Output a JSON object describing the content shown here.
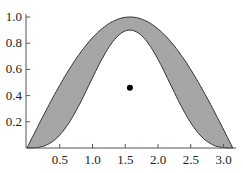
{
  "chart_data": {
    "type": "area",
    "title": "",
    "xlabel": "",
    "ylabel": "",
    "xlim": [
      0,
      3.1416
    ],
    "ylim": [
      0,
      1.0
    ],
    "x_ticks": [
      "0.5",
      "1.0",
      "1.5",
      "2.0",
      "2.5",
      "3.0"
    ],
    "y_ticks": [
      "0.2",
      "0.4",
      "0.6",
      "0.8",
      "1.0"
    ],
    "grid": false,
    "legend": null,
    "series": [
      {
        "name": "upper",
        "description": "sin(x)",
        "peak": 1.0,
        "x_peak": 1.571
      },
      {
        "name": "lower",
        "description": "approx 0.9*sin(x)^3",
        "peak": 0.9,
        "x_peak": 1.571
      }
    ],
    "fill_between": {
      "upper": "upper",
      "lower": "lower",
      "color": "#a6a6a6"
    },
    "points": [
      {
        "x": 1.571,
        "y": 0.46
      }
    ]
  }
}
